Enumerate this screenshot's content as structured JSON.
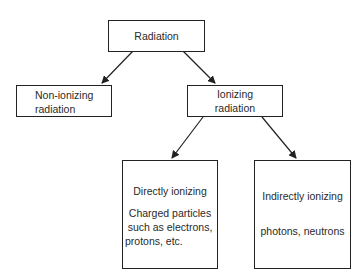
{
  "diagram": {
    "type": "tree",
    "nodes": {
      "root": {
        "label": "Radiation"
      },
      "non_ionizing": {
        "line1": "Non-ionizing",
        "line2": "radiation"
      },
      "ionizing": {
        "line1": "Ionizing",
        "line2": "radiation"
      },
      "directly": {
        "title": "Directly ionizing",
        "desc1": "Charged particles",
        "desc2": "such as electrons,",
        "desc3": "protons, etc."
      },
      "indirectly": {
        "title": "Indirectly ionizing",
        "desc1": "photons, neutrons"
      }
    },
    "edges": [
      [
        "root",
        "non_ionizing"
      ],
      [
        "root",
        "ionizing"
      ],
      [
        "ionizing",
        "directly"
      ],
      [
        "ionizing",
        "indirectly"
      ]
    ]
  }
}
